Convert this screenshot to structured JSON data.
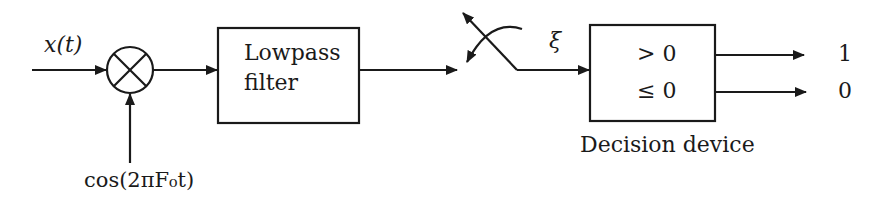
{
  "diagram": {
    "input_label": "x(t)",
    "carrier_label": "cos(2πF₀t)",
    "mixer_symbol": "multiplier",
    "lowpass": {
      "line1": "Lowpass",
      "line2": "filter"
    },
    "switch_symbol": "sampler-switch",
    "sample_label": "ξ",
    "decision": {
      "rule_top": "> 0",
      "rule_bottom": "≤ 0",
      "caption": "Decision device",
      "output_top": "1",
      "output_bottom": "0"
    }
  },
  "colors": {
    "stroke": "#1a1a1a",
    "background": "#ffffff"
  }
}
